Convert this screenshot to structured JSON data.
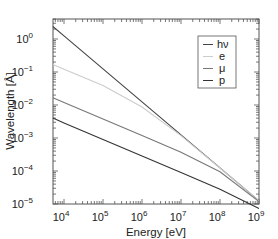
{
  "chart_data": {
    "type": "line",
    "title": "",
    "xlabel": "Energy [eV]",
    "ylabel": "Wavelength [Å]",
    "xscale": "log",
    "yscale": "log",
    "xlim": [
      5200,
      1000000000
    ],
    "ylim": [
      1e-05,
      5
    ],
    "x_ticks": [
      10000,
      100000,
      1000000,
      10000000,
      100000000,
      1000000000
    ],
    "x_tick_labels": [
      "10^4",
      "10^5",
      "10^6",
      "10^7",
      "10^8",
      "10^9"
    ],
    "y_ticks": [
      1,
      0.1,
      0.01,
      0.001,
      0.0001,
      1e-05
    ],
    "y_tick_labels": [
      "10^0",
      "10^-1",
      "10^-2",
      "10^-3",
      "10^-4",
      "10^-5"
    ],
    "grid": false,
    "legend_position": "upper right",
    "series": [
      {
        "name": "hν",
        "color": "#444444",
        "x": [
          5200,
          10000,
          100000,
          1000000,
          10000000,
          100000000,
          1000000000
        ],
        "y": [
          2.4,
          1.24,
          0.124,
          0.0124,
          0.00124,
          0.000124,
          1.24e-05
        ]
      },
      {
        "name": "e",
        "color": "#cccccc",
        "x": [
          5200,
          10000,
          100000,
          1000000,
          10000000,
          100000000,
          1000000000
        ],
        "y": [
          0.17,
          0.122,
          0.0388,
          0.0087,
          0.00118,
          0.000123,
          1.24e-05
        ]
      },
      {
        "name": "μ",
        "color": "#777777",
        "x": [
          5200,
          10000,
          100000,
          1000000,
          10000000,
          100000000,
          1000000000
        ],
        "y": [
          0.0167,
          0.012,
          0.0038,
          0.0012,
          0.00037,
          9.5e-05,
          1.18e-05
        ]
      },
      {
        "name": "p",
        "color": "#333333",
        "x": [
          5200,
          10000,
          100000,
          1000000,
          10000000,
          100000000,
          1000000000
        ],
        "y": [
          0.004,
          0.00286,
          0.000905,
          0.000286,
          9.04e-05,
          2.81e-05,
          7.3e-06
        ]
      }
    ]
  },
  "labels": {
    "xlabel": "Energy [eV]",
    "ylabel": "Wavelength [Å]",
    "x_ticks": [
      {
        "base": "10",
        "exp": "4"
      },
      {
        "base": "10",
        "exp": "5"
      },
      {
        "base": "10",
        "exp": "6"
      },
      {
        "base": "10",
        "exp": "7"
      },
      {
        "base": "10",
        "exp": "8"
      },
      {
        "base": "10",
        "exp": "9"
      }
    ],
    "y_ticks": [
      {
        "base": "10",
        "exp": "0"
      },
      {
        "base": "10",
        "exp": "−1"
      },
      {
        "base": "10",
        "exp": "−2"
      },
      {
        "base": "10",
        "exp": "−3"
      },
      {
        "base": "10",
        "exp": "−4"
      },
      {
        "base": "10",
        "exp": "−5"
      }
    ],
    "legend": [
      "hν",
      "e",
      "μ",
      "p"
    ]
  }
}
